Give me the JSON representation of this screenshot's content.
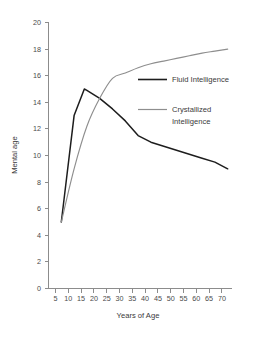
{
  "chart_data": {
    "type": "line",
    "title": "",
    "xlabel": "Years of Age",
    "ylabel": "Mental age",
    "xlim": [
      0,
      72
    ],
    "ylim": [
      0,
      20
    ],
    "grid": false,
    "legend_position": "upper-right-inside",
    "x_ticks": [
      5,
      10,
      15,
      20,
      25,
      30,
      35,
      40,
      45,
      50,
      55,
      60,
      65,
      70
    ],
    "y_ticks": [
      0,
      2,
      4,
      6,
      8,
      10,
      12,
      14,
      16,
      18,
      20
    ],
    "series": [
      {
        "name": "Fluid Intelligence",
        "color": "#1d1d1d",
        "x": [
          5,
          10,
          14,
          15,
          20,
          25,
          30,
          35,
          40,
          45,
          50,
          55,
          60,
          65,
          70
        ],
        "values": [
          5.0,
          13.0,
          15.0,
          14.9,
          14.3,
          13.5,
          12.6,
          11.5,
          11.0,
          10.7,
          10.4,
          10.1,
          9.8,
          9.5,
          9.0
        ]
      },
      {
        "name": "Crystallized Intelligence",
        "color": "#8e8e8e",
        "x": [
          5,
          10,
          15,
          20,
          25,
          30,
          35,
          40,
          45,
          50,
          55,
          60,
          65,
          70
        ],
        "values": [
          5.0,
          9.0,
          12.2,
          14.3,
          15.8,
          16.2,
          16.6,
          16.9,
          17.1,
          17.3,
          17.5,
          17.7,
          17.85,
          18.0
        ]
      }
    ]
  },
  "axes": {
    "y_title": "Mental age",
    "x_title": "Years of Age",
    "y_tick_labels": [
      "20",
      "18",
      "16",
      "14",
      "12",
      "10",
      "8",
      "6",
      "4",
      "2",
      "0"
    ],
    "x_tick_labels": [
      "5",
      "10",
      "15",
      "20",
      "25",
      "30",
      "35",
      "40",
      "45",
      "50",
      "55",
      "60",
      "65",
      "70"
    ]
  },
  "legend": {
    "fluid_label": "Fluid Intelligence",
    "crystallized_label_line1": "Crystallized",
    "crystallized_label_line2": "Intelligence"
  },
  "caption": {
    "partial_text": ""
  }
}
